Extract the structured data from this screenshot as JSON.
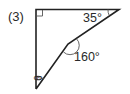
{
  "problem": {
    "number": "(3)"
  },
  "diagram": {
    "labels": {
      "angle_top_right": "35°",
      "angle_bend": "160°",
      "angle_bottom": "θ"
    },
    "right_angle_marker": "top-left",
    "stroke_color": "#222222"
  }
}
